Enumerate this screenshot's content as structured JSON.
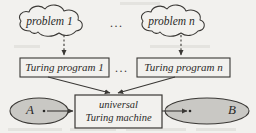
{
  "figure": {
    "background_color": "#f2f1ee",
    "stroke_color": "#3a3835",
    "fill_gray": "#c9c8c4"
  },
  "clouds": [
    {
      "label": "problem 1",
      "name": "cloud-problem-1"
    },
    {
      "label": "problem n",
      "name": "cloud-problem-n"
    }
  ],
  "cloud_ellipsis": "...",
  "program_boxes": [
    {
      "label": "Turing program 1",
      "name": "box-turing-program-1"
    },
    {
      "label": "Turing program n",
      "name": "box-turing-program-n"
    }
  ],
  "program_ellipsis": "...",
  "machine": {
    "line1": "universal",
    "line2": "Turing machine"
  },
  "sets": {
    "input": {
      "label": "A"
    },
    "output": {
      "label": "B"
    }
  },
  "edges": {
    "cloud_to_program_style": "dashed",
    "program_to_machine_style": "solid",
    "input_to_machine_style": "solid",
    "machine_to_output_style": "solid"
  }
}
